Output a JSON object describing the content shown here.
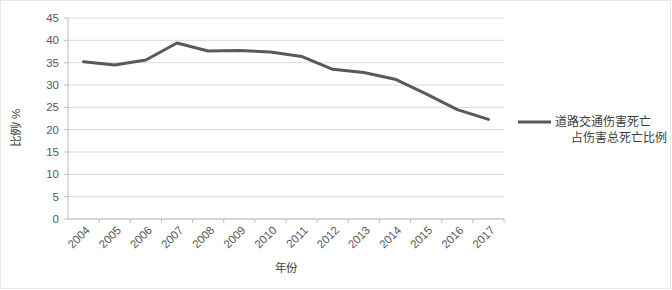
{
  "chart_data": {
    "type": "line",
    "title": "",
    "xlabel": "年份",
    "ylabel": "比例/ %",
    "categories": [
      "2004",
      "2005",
      "2006",
      "2007",
      "2008",
      "2009",
      "2010",
      "2011",
      "2012",
      "2013",
      "2014",
      "2015",
      "2016",
      "2017"
    ],
    "series": [
      {
        "name": "道路交通伤害死亡占伤害总死亡比例",
        "values": [
          35.2,
          34.5,
          35.6,
          39.4,
          37.6,
          37.7,
          37.4,
          36.4,
          33.5,
          32.8,
          31.3,
          28.0,
          24.5,
          22.3
        ],
        "color": "#595959"
      }
    ],
    "ylim": [
      0,
      45
    ],
    "ytick_labels": [
      "45",
      "40",
      "35",
      "30",
      "25",
      "20",
      "15",
      "10",
      "5",
      "0"
    ],
    "ytick_values": [
      45,
      40,
      35,
      30,
      25,
      20,
      15,
      10,
      5,
      0
    ],
    "grid": true,
    "grid_color": "#d9d9d9",
    "legend_position": "right",
    "legend": [
      {
        "line1": "道路交通伤害死亡",
        "line2": "占伤害总死亡比例",
        "swatch_color": "#595959"
      }
    ],
    "xtick_rotation": "45"
  }
}
